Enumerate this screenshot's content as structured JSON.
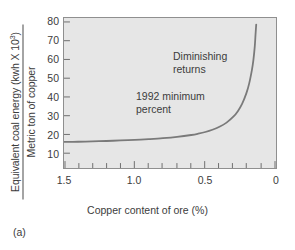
{
  "figure": {
    "panel_label": "(a)"
  },
  "chart_data": {
    "type": "line",
    "title": "",
    "subtitle": "",
    "xlabel": "Copper content of ore (%)",
    "ylabel_numerator": "Equivalent coal energy (kwh X 10",
    "ylabel_numerator_sup": "3",
    "ylabel_numerator_close": ")",
    "ylabel_denominator": "Metric ton of copper",
    "xlim": [
      1.5,
      0.0
    ],
    "ylim": [
      0,
      80
    ],
    "x_reversed": true,
    "grid": false,
    "legend": null,
    "xticks": [
      1.5,
      1.0,
      0.5,
      0
    ],
    "xtick_labels": [
      "1.5",
      "1.0",
      "0.5",
      "0"
    ],
    "xminor_step": 0.1,
    "yticks": [
      10,
      20,
      30,
      40,
      50,
      60,
      70,
      80
    ],
    "ytick_labels": [
      "80",
      "70",
      "60",
      "50",
      "40",
      "30",
      "20",
      "10"
    ],
    "series": [
      {
        "name": "Equivalent coal energy vs copper content",
        "color": "#7a7a7a",
        "linewidth": 1.8,
        "x": [
          1.5,
          1.4,
          1.3,
          1.2,
          1.1,
          1.0,
          0.9,
          0.8,
          0.7,
          0.6,
          0.55,
          0.5,
          0.45,
          0.4,
          0.35,
          0.3,
          0.27,
          0.24,
          0.21,
          0.19,
          0.17,
          0.16,
          0.15,
          0.145,
          0.14
        ],
        "y": [
          13.9,
          14.0,
          14.2,
          14.4,
          14.7,
          15.0,
          15.4,
          15.9,
          16.6,
          17.6,
          18.3,
          19.2,
          20.4,
          22.0,
          24.2,
          27.5,
          30.3,
          34.2,
          39.8,
          45.0,
          52.5,
          57.5,
          65.0,
          71.0,
          76.5
        ]
      }
    ],
    "annotations": [
      {
        "id": "diminishing",
        "line1": "Diminishing",
        "line2": "returns"
      },
      {
        "id": "minimum",
        "line1": "1992 minimum",
        "line2": "percent"
      }
    ],
    "colors": {
      "plot_background": "#e6e6e6",
      "axis": "#8f8f8f",
      "curve": "#7a7a7a",
      "text": "#3c3c3c"
    }
  }
}
